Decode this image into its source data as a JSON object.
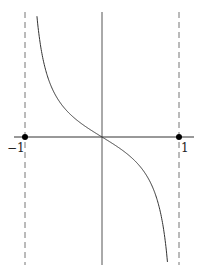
{
  "chart_data": {
    "type": "line",
    "title": "",
    "xlabel": "",
    "ylabel": "",
    "function": "y = -tan(pi*x/2)",
    "x_ticks": [
      "-1",
      "1"
    ],
    "xlim": [
      -1,
      1
    ],
    "asymptotes": [
      -1,
      1
    ],
    "marked_points": [
      {
        "x": -1,
        "y": 0
      },
      {
        "x": 1,
        "y": 0
      }
    ],
    "series": [
      {
        "name": "curve",
        "x": [
          -0.95,
          -0.8,
          -0.6,
          -0.4,
          -0.2,
          0,
          0.2,
          0.4,
          0.6,
          0.8,
          0.95
        ],
        "y": [
          12.7,
          3.08,
          1.38,
          0.73,
          0.32,
          0,
          -0.32,
          -0.73,
          -1.38,
          -3.08,
          -12.7
        ]
      }
    ],
    "grid": false,
    "legend": "none"
  },
  "labels": {
    "left_tick": "−1",
    "right_tick": "1"
  }
}
